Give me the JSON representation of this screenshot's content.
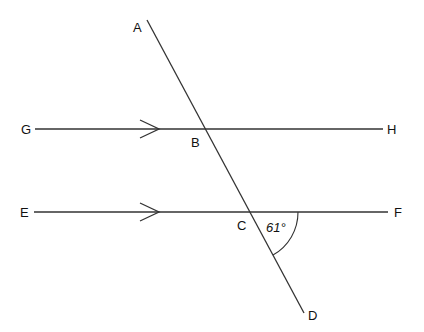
{
  "diagram": {
    "points": {
      "A": "A",
      "B": "B",
      "C": "C",
      "D": "D",
      "E": "E",
      "F": "F",
      "G": "G",
      "H": "H"
    },
    "angle_label": "61°",
    "colors": {
      "line": "#333333",
      "text": "#111111",
      "background": "#ffffff"
    },
    "lines": [
      {
        "name": "GH",
        "from": "G",
        "to": "H",
        "parallel_marker": true
      },
      {
        "name": "EF",
        "from": "E",
        "to": "F",
        "parallel_marker": true
      },
      {
        "name": "AD",
        "from": "A",
        "to": "D",
        "transversal": true
      }
    ],
    "angles": [
      {
        "vertex": "C",
        "between": [
          "CF",
          "CD"
        ],
        "value": "61°"
      }
    ]
  }
}
